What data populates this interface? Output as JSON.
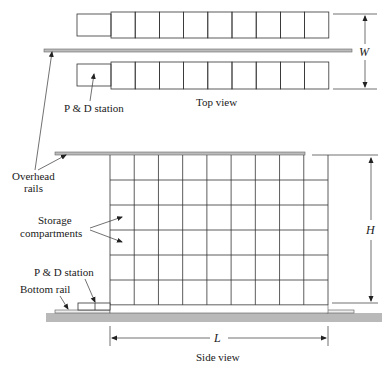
{
  "diagram": {
    "type": "AS/RS storage rack layout",
    "top_view": {
      "caption": "Top view",
      "rows": 2,
      "compartments_per_row": 9,
      "pd_station_label": "P & D station",
      "dimension_label": "W"
    },
    "side_view": {
      "caption": "Side view",
      "columns": 9,
      "levels": 6,
      "labels": {
        "overhead_rails": [
          "Overhead",
          "rails"
        ],
        "storage_compartments": [
          "Storage",
          "compartments"
        ],
        "pd_station": "P & D station",
        "bottom_rail": "Bottom rail"
      },
      "length_label": "L",
      "height_label": "H"
    },
    "colors": {
      "line": "#333333",
      "ground": "#b9b9b9",
      "rail": "#9a9a9a"
    }
  }
}
